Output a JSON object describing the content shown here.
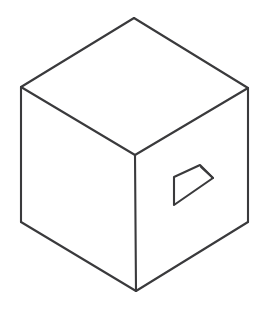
{
  "figure": {
    "title": "Isometric Cube With Recessed Quadrilateral Opening",
    "background_color": "#ffffff",
    "stroke_color": "#3a3a3c",
    "stroke_width": 2.1,
    "canvas": {
      "width": 267,
      "height": 317
    }
  },
  "geometry": {
    "vertices": {
      "top_apex": {
        "x": 134,
        "y": 18
      },
      "left_upper": {
        "x": 21,
        "y": 87
      },
      "right_upper": {
        "x": 248,
        "y": 88
      },
      "center_front": {
        "x": 135,
        "y": 155
      },
      "left_lower": {
        "x": 21,
        "y": 222
      },
      "right_lower": {
        "x": 248,
        "y": 222
      },
      "bottom_apex": {
        "x": 136,
        "y": 291
      }
    },
    "faces": [
      {
        "name": "top-face",
        "points": "134,18 248,88 135,155 21,87"
      },
      {
        "name": "left-face",
        "points": "21,87 135,155 136,291 21,222"
      },
      {
        "name": "right-face",
        "points": "135,155 248,88 248,222 136,291"
      }
    ],
    "edges": [
      {
        "name": "top-left-edge",
        "d": "M 21,87 L 134,18"
      },
      {
        "name": "top-right-edge",
        "d": "M 134,18 L 248,88"
      },
      {
        "name": "top-face-inner-left",
        "d": "M 21,87 L 135,155"
      },
      {
        "name": "top-face-inner-right",
        "d": "M 135,155 L 248,88"
      },
      {
        "name": "left-silhouette-edge",
        "d": "M 21,87 L 21,222"
      },
      {
        "name": "right-silhouette-edge",
        "d": "M 248,88 L 248,222"
      },
      {
        "name": "front-vertical-edge",
        "d": "M 135,155 L 136,291"
      },
      {
        "name": "bottom-left-edge",
        "d": "M 21,222 L 136,291"
      },
      {
        "name": "bottom-right-edge",
        "d": "M 136,291 L 248,222"
      }
    ],
    "hole": {
      "name": "recessed-quadrilateral-opening",
      "face": "right-face",
      "outline_points": "174,177 200,165 213,178 174,205",
      "vertices": {
        "top_left": {
          "x": 174,
          "y": 177
        },
        "top_right": {
          "x": 200,
          "y": 165
        },
        "right": {
          "x": 213,
          "y": 178
        },
        "bottom_left": {
          "x": 174,
          "y": 205
        }
      },
      "depth_sliver": {
        "name": "hole-depth-line",
        "d": "M 201,167 L 213,178"
      }
    }
  }
}
